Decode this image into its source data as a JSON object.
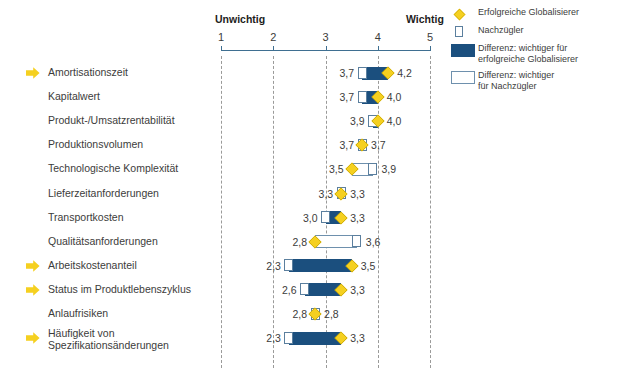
{
  "chart_data": {
    "type": "bar",
    "title": "",
    "xlabel": "",
    "ylabel": "",
    "xlim": [
      1,
      5
    ],
    "x_ticks": [
      1,
      2,
      3,
      4,
      5
    ],
    "x_tick_labels": [
      "1",
      "2",
      "3",
      "4",
      "5"
    ],
    "axis_left_caption": "Unwichtig",
    "axis_right_caption": "Wichtig",
    "grid": true,
    "legend_position": "top-right",
    "series": [
      {
        "name": "Erfolgreiche Globalisierer",
        "marker": "diamond",
        "values": [
          4.2,
          4.0,
          4.0,
          3.7,
          3.5,
          3.3,
          3.3,
          2.8,
          3.5,
          3.3,
          2.8,
          3.3
        ]
      },
      {
        "name": "Nachzügler",
        "marker": "square",
        "values": [
          3.7,
          3.7,
          3.9,
          3.7,
          3.9,
          3.3,
          3.0,
          3.6,
          2.3,
          2.6,
          2.8,
          2.3
        ]
      }
    ],
    "categories": [
      "Amortisationszeit",
      "Kapitalwert",
      "Produkt-/Umsatzrentabilität",
      "Produktionsvolumen",
      "Technologische Komplexität",
      "Lieferzeitanforderungen",
      "Transportkosten",
      "Qualitätsanforderungen",
      "Arbeitskostenanteil",
      "Status im Produktlebenszyklus",
      "Anlaufrisiken",
      "Häufigkeit von Spezifikationsänderungen"
    ],
    "rows": [
      {
        "label": "Amortisationszeit",
        "label_line2": "",
        "highlight": true,
        "left_value": "3,7",
        "right_value": "4,2",
        "low": 3.7,
        "high": 4.2,
        "diff_favors": "globalisierer"
      },
      {
        "label": "Kapitalwert",
        "label_line2": "",
        "highlight": false,
        "left_value": "3,7",
        "right_value": "4,0",
        "low": 3.7,
        "high": 4.0,
        "diff_favors": "globalisierer"
      },
      {
        "label": "Produkt-/Umsatzrentabilität",
        "label_line2": "",
        "highlight": false,
        "left_value": "3,9",
        "right_value": "4,0",
        "low": 3.9,
        "high": 4.0,
        "diff_favors": "globalisierer"
      },
      {
        "label": "Produktionsvolumen",
        "label_line2": "",
        "highlight": false,
        "left_value": "3,7",
        "right_value": "3,7",
        "low": 3.7,
        "high": 3.7,
        "diff_favors": "nachzuegler"
      },
      {
        "label": "Technologische Komplexität",
        "label_line2": "",
        "highlight": false,
        "left_value": "3,5",
        "right_value": "3,9",
        "low": 3.5,
        "high": 3.9,
        "diff_favors": "nachzuegler"
      },
      {
        "label": "Lieferzeitanforderungen",
        "label_line2": "",
        "highlight": false,
        "left_value": "3,3",
        "right_value": "3,3",
        "low": 3.3,
        "high": 3.3,
        "diff_favors": "nachzuegler"
      },
      {
        "label": "Transportkosten",
        "label_line2": "",
        "highlight": false,
        "left_value": "3,0",
        "right_value": "3,3",
        "low": 3.0,
        "high": 3.3,
        "diff_favors": "globalisierer"
      },
      {
        "label": "Qualitätsanforderungen",
        "label_line2": "",
        "highlight": false,
        "left_value": "2,8",
        "right_value": "3,6",
        "low": 2.8,
        "high": 3.6,
        "diff_favors": "nachzuegler"
      },
      {
        "label": "Arbeitskostenanteil",
        "label_line2": "",
        "highlight": true,
        "left_value": "2,3",
        "right_value": "3,5",
        "low": 2.3,
        "high": 3.5,
        "diff_favors": "globalisierer"
      },
      {
        "label": "Status im Produktlebenszyklus",
        "label_line2": "",
        "highlight": true,
        "left_value": "2,6",
        "right_value": "3,3",
        "low": 2.6,
        "high": 3.3,
        "diff_favors": "globalisierer"
      },
      {
        "label": "Anlaufrisiken",
        "label_line2": "",
        "highlight": false,
        "left_value": "2,8",
        "right_value": "2,8",
        "low": 2.8,
        "high": 2.8,
        "diff_favors": "globalisierer"
      },
      {
        "label": "Häufigkeit von",
        "label_line2": "Spezifikationsänderungen",
        "highlight": true,
        "left_value": "2,3",
        "right_value": "3,3",
        "low": 2.3,
        "high": 3.3,
        "diff_favors": "globalisierer"
      }
    ],
    "legend": [
      {
        "marker": "diamond",
        "text_line1": "Erfolgreiche Globalisierer",
        "text_line2": ""
      },
      {
        "marker": "square",
        "text_line1": "Nachzügler",
        "text_line2": ""
      },
      {
        "marker": "fill-bar",
        "text_line1": "Differenz: wichtiger für",
        "text_line2": "erfolgreiche Globalisierer"
      },
      {
        "marker": "hollow-bar",
        "text_line1": "Differenz: wichtiger",
        "text_line2": "für Nachzügler"
      }
    ],
    "colors": {
      "bar_fill": "#1b4f7e",
      "bar_outline": "#6e90ad",
      "diamond": "#f5d020",
      "axis": "#3f6f91",
      "grid": "#9a9a99",
      "arrow": "#f5d020",
      "text": "#3c3c3b"
    }
  }
}
